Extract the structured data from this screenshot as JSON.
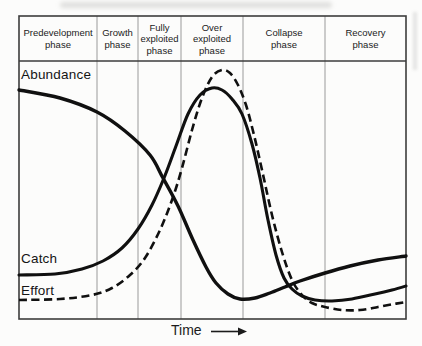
{
  "diagram": {
    "phases": [
      "Predevelopment\nphase",
      "Growth\nphase",
      "Fully\nexploited\nphase",
      "Over\nexploited\nphase",
      "Collapse\nphase",
      "Recovery\nphase"
    ],
    "curves": [
      {
        "name": "abundance",
        "label": "Abundance",
        "style": "solid",
        "stroke": "#101010",
        "width": 3.4,
        "points": [
          [
            19,
            90
          ],
          [
            60,
            98
          ],
          [
            97,
            112
          ],
          [
            125,
            131
          ],
          [
            150,
            155
          ],
          [
            163,
            178
          ],
          [
            178,
            206
          ],
          [
            193,
            240
          ],
          [
            206,
            267
          ],
          [
            216,
            283
          ],
          [
            228,
            294
          ],
          [
            240,
            299
          ],
          [
            255,
            298
          ],
          [
            270,
            293
          ],
          [
            285,
            287
          ],
          [
            300,
            281
          ],
          [
            325,
            273
          ],
          [
            350,
            266
          ],
          [
            378,
            260
          ],
          [
            406,
            256
          ]
        ]
      },
      {
        "name": "catch",
        "label": "Catch",
        "style": "solid",
        "stroke": "#101010",
        "width": 3.1,
        "points": [
          [
            19,
            275
          ],
          [
            55,
            274
          ],
          [
            82,
            269
          ],
          [
            103,
            261
          ],
          [
            122,
            248
          ],
          [
            138,
            229
          ],
          [
            152,
            205
          ],
          [
            164,
            178
          ],
          [
            176,
            146
          ],
          [
            188,
            114
          ],
          [
            200,
            95
          ],
          [
            212,
            88
          ],
          [
            222,
            90
          ],
          [
            232,
            99
          ],
          [
            242,
            114
          ],
          [
            252,
            144
          ],
          [
            260,
            178
          ],
          [
            268,
            220
          ],
          [
            276,
            255
          ],
          [
            284,
            278
          ],
          [
            292,
            289
          ],
          [
            302,
            296
          ],
          [
            315,
            300
          ],
          [
            332,
            301
          ],
          [
            352,
            299
          ],
          [
            375,
            294
          ],
          [
            392,
            290
          ],
          [
            406,
            286
          ]
        ]
      },
      {
        "name": "effort",
        "label": "Effort",
        "style": "dashed",
        "stroke": "#101010",
        "width": 2.6,
        "points": [
          [
            19,
            300
          ],
          [
            60,
            299
          ],
          [
            92,
            295
          ],
          [
            112,
            288
          ],
          [
            130,
            275
          ],
          [
            145,
            258
          ],
          [
            160,
            230
          ],
          [
            172,
            200
          ],
          [
            182,
            168
          ],
          [
            192,
            130
          ],
          [
            202,
            98
          ],
          [
            212,
            77
          ],
          [
            222,
            70
          ],
          [
            230,
            73
          ],
          [
            238,
            85
          ],
          [
            246,
            105
          ],
          [
            254,
            135
          ],
          [
            262,
            170
          ],
          [
            272,
            215
          ],
          [
            282,
            252
          ],
          [
            292,
            280
          ],
          [
            302,
            295
          ],
          [
            312,
            303
          ],
          [
            325,
            307
          ],
          [
            342,
            310
          ],
          [
            360,
            310
          ],
          [
            378,
            307
          ],
          [
            394,
            304
          ],
          [
            406,
            302
          ]
        ]
      }
    ],
    "x_axis": {
      "label": "Time"
    },
    "colors": {
      "border": "#3c3c3c",
      "divider": "#9a9a9a",
      "ink": "#101010"
    }
  }
}
